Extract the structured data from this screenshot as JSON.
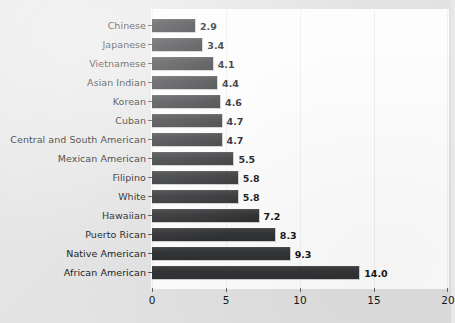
{
  "chart_data": {
    "type": "bar",
    "orientation": "horizontal",
    "title": "",
    "subtitle": "",
    "xlabel": "",
    "ylabel": "",
    "xlim": [
      0,
      20
    ],
    "xticks": [
      "0",
      "5",
      "10",
      "15",
      "20"
    ],
    "grid": true,
    "grid_axis": "x",
    "legend": "none",
    "bar_color": "#333436",
    "plot_background": "#fdfdfd",
    "figure_background": "#e6e6e6",
    "categories": [
      "Chinese",
      "Japanese",
      "Vietnamese",
      "Asian Indian",
      "Korean",
      "Cuban",
      "Central and South American",
      "Mexican American",
      "Filipino",
      "White",
      "Hawaiian",
      "Puerto Rican",
      "Native American",
      "African American"
    ],
    "values": [
      2.9,
      3.4,
      4.1,
      4.4,
      4.6,
      4.7,
      4.7,
      5.5,
      5.8,
      5.8,
      7.2,
      8.3,
      9.3,
      14.0
    ],
    "value_labels": [
      "2.9",
      "3.4",
      "4.1",
      "4.4",
      "4.6",
      "4.7",
      "4.7",
      "5.5",
      "5.8",
      "5.8",
      "7.2",
      "8.3",
      "9.3",
      "14.0"
    ]
  }
}
